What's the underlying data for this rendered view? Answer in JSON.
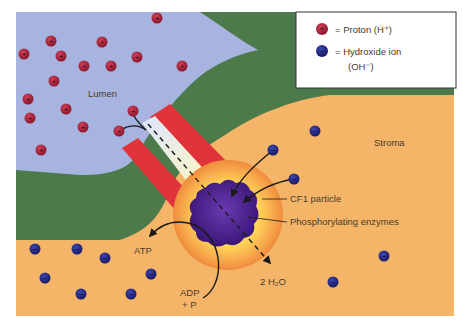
{
  "legend": {
    "proton_label": "= Proton (H⁺)",
    "hydroxide_label_line1": "= Hydroxide ion",
    "hydroxide_label_line2": "(OH⁻)",
    "proton_symbol": "+",
    "hydroxide_symbol": "−"
  },
  "regions": {
    "lumen": "Lumen",
    "stroma": "Stroma"
  },
  "labels": {
    "cf1": "CF1 particle",
    "enzymes": "Phosphorylating enzymes",
    "atp": "ATP",
    "adp_line1": "ADP",
    "adp_line2": "+ P",
    "water": "2 H₂O"
  },
  "colors": {
    "lumen": "#a7b4e0",
    "membrane": "#4c7a4a",
    "stroma": "#f5b568",
    "channel": "#e0343a",
    "proton": "#b8283e",
    "hydroxide": "#2a2f8a",
    "enzyme": "#4a1e8a"
  },
  "protons": [
    [
      157,
      18
    ],
    [
      51,
      41
    ],
    [
      102,
      42
    ],
    [
      24,
      54
    ],
    [
      61,
      56
    ],
    [
      137,
      57
    ],
    [
      84,
      66
    ],
    [
      111,
      66
    ],
    [
      54,
      81
    ],
    [
      182,
      66
    ],
    [
      28,
      99
    ],
    [
      66,
      109
    ],
    [
      30,
      118
    ],
    [
      83,
      127
    ],
    [
      133,
      111
    ],
    [
      119,
      131
    ],
    [
      41,
      150
    ]
  ],
  "hydroxides": [
    [
      315,
      131
    ],
    [
      273,
      150
    ],
    [
      294,
      179
    ],
    [
      35,
      249
    ],
    [
      77,
      249
    ],
    [
      105,
      258
    ],
    [
      45,
      278
    ],
    [
      151,
      274
    ],
    [
      81,
      294
    ],
    [
      131,
      294
    ],
    [
      384,
      256
    ],
    [
      333,
      282
    ]
  ]
}
